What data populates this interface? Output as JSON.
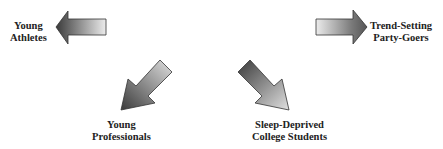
{
  "diagram": {
    "type": "radial-arrows",
    "segments": [
      {
        "id": "young-athletes",
        "line1": "Young",
        "line2": "Athletes",
        "direction": "left"
      },
      {
        "id": "trend-setting-party-goers",
        "line1": "Trend-Setting",
        "line2": "Party-Goers",
        "direction": "right"
      },
      {
        "id": "young-professionals",
        "line1": "Young",
        "line2": "Professionals",
        "direction": "down-left"
      },
      {
        "id": "sleep-deprived-college-students",
        "line1": "Sleep-Deprived",
        "line2": "College Students",
        "direction": "down-right"
      }
    ],
    "colors": {
      "arrow_dark": "#3a3a3a",
      "arrow_light": "#e8e8e8",
      "text": "#222222",
      "background": "#ffffff"
    }
  }
}
